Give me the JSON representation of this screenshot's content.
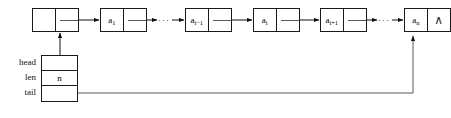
{
  "diagram": {
    "colors": {
      "stroke": "#1a1a1a",
      "pointer_line": "#5a5a5a",
      "background": "#ffffff",
      "text": "#111111"
    },
    "nodes": [
      {
        "id": "head-node",
        "data_label": "",
        "next_label": "",
        "data_sub": ""
      },
      {
        "id": "node-a1",
        "data_label": "a",
        "data_sub": "1",
        "next_label": ""
      },
      {
        "id": "node-ai-1",
        "data_label": "a",
        "data_sub": "i−1",
        "next_label": ""
      },
      {
        "id": "node-ai",
        "data_label": "a",
        "data_sub": "i",
        "next_label": ""
      },
      {
        "id": "node-ai+1",
        "data_label": "a",
        "data_sub": "i+1",
        "next_label": ""
      },
      {
        "id": "node-an",
        "data_label": "a",
        "data_sub": "n",
        "next_label": "∧"
      }
    ],
    "ellipses": [
      {
        "id": "ellipsis-left",
        "text": "···"
      },
      {
        "id": "ellipsis-right",
        "text": "···"
      }
    ],
    "control_block": {
      "rows": [
        {
          "label": "head",
          "value": ""
        },
        {
          "label": "len",
          "value": "n"
        },
        {
          "label": "tail",
          "value": ""
        }
      ]
    },
    "nil_symbol": "∧"
  }
}
